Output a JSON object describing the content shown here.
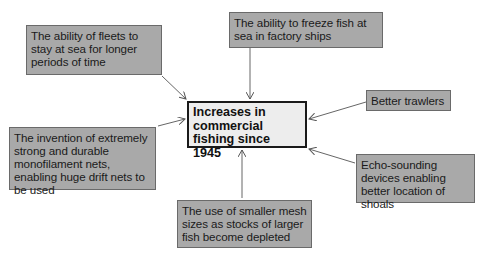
{
  "diagram": {
    "center": {
      "label": "Increases in commercial fishing since 1945"
    },
    "causes": [
      {
        "id": "fleets",
        "label": "The ability of fleets to stay at sea for longer periods of time"
      },
      {
        "id": "freeze",
        "label": "The ability to freeze fish at sea in factory ships"
      },
      {
        "id": "trawlers",
        "label": "Better trawlers"
      },
      {
        "id": "nets",
        "label": "The invention of extremely strong and durable monofilament nets, enabling huge drift nets to be used"
      },
      {
        "id": "echo",
        "label": "Echo-sounding devices enabling better location of shoals"
      },
      {
        "id": "mesh",
        "label": "The use of smaller mesh sizes as stocks of larger fish become depleted"
      }
    ],
    "colors": {
      "cause_fill": "#a9a9a9",
      "center_fill": "#ededed",
      "border": "#1a1a1a",
      "arrow": "#555555"
    }
  }
}
